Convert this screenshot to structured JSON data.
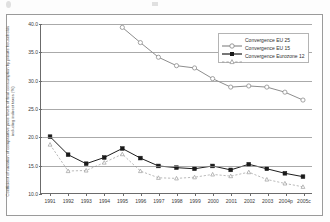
{
  "chart_data": {
    "type": "line",
    "title": "",
    "xlabel": "",
    "ylabel": "Coefficient of variation of comparative price levels of final consumption by private households including indirect taxes (%)",
    "categories": [
      "1991",
      "1992",
      "1993",
      "1994",
      "1995",
      "1996",
      "1997",
      "1998",
      "1999",
      "2000",
      "2001",
      "2002",
      "2003",
      "2004p",
      "2005c"
    ],
    "ylim": [
      10.0,
      40.0
    ],
    "yticks": [
      "10.0",
      "15.0",
      "20.0",
      "25.0",
      "30.0",
      "35.0",
      "40.0"
    ],
    "ytick_values": [
      10.0,
      15.0,
      20.0,
      25.0,
      30.0,
      35.0,
      40.0
    ],
    "grid": true,
    "legend_position": "top-right",
    "series": [
      {
        "name": "Convergence EU 25",
        "color": "#8c8c8c",
        "marker": "open-circle",
        "dash": "solid",
        "values": [
          null,
          null,
          null,
          null,
          39.4,
          36.7,
          34.1,
          32.6,
          32.2,
          30.3,
          28.8,
          29.0,
          28.8,
          27.9,
          26.5
        ]
      },
      {
        "name": "Convergence EU 15",
        "color": "#1a1a1a",
        "marker": "filled-square",
        "dash": "solid",
        "values": [
          20.0,
          16.8,
          15.2,
          16.3,
          17.9,
          16.2,
          14.8,
          14.5,
          14.3,
          14.8,
          14.1,
          15.1,
          14.3,
          13.5,
          12.9
        ]
      },
      {
        "name": "Convergence Eurozone 12",
        "color": "#9b9b9b",
        "marker": "small-triangle",
        "dash": "dashed",
        "values": [
          18.6,
          13.9,
          14.0,
          15.4,
          16.9,
          13.9,
          12.7,
          12.6,
          12.8,
          13.3,
          13.0,
          13.7,
          12.4,
          11.7,
          11.1
        ]
      }
    ]
  },
  "legend": {
    "entries": [
      {
        "label": "Convergence EU 25"
      },
      {
        "label": "Convergence EU 15"
      },
      {
        "label": "Convergence Eurozone 12"
      }
    ]
  },
  "axis": {
    "y_title": "Coefficient of variation of comparative price levels of final consumption by private households including indirect taxes (%)"
  }
}
